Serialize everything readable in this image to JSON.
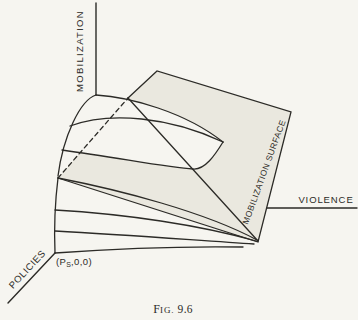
{
  "axes": {
    "vertical": "MOBILIZATION",
    "horizontal": "VIOLENCE",
    "depth": "POLICIES"
  },
  "surface_label": "MOBILIZATION SURFACE",
  "origin_label": {
    "open": "(P",
    "subscript": "S",
    "close": ",0,0)"
  },
  "figure_caption": {
    "prefix": "F",
    "smallcaps": "IG.",
    "number": "9.6"
  },
  "colors": {
    "background": "#f6f5f0",
    "surface_fill": "#eae8df",
    "ink": "#2c2b27"
  }
}
